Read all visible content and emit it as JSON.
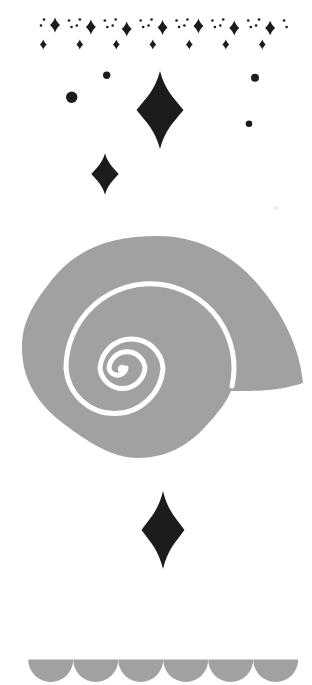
{
  "illustration": {
    "kind": "decorative-illustration",
    "description": "snail shell with sparkles and scallop trim",
    "canvas": {
      "width": 312,
      "height": 685,
      "background": "#ffffff"
    },
    "palette": {
      "gray": "#a1a1a1",
      "black": "#1c1c1c",
      "white": "#ffffff",
      "faint": "#dedede"
    },
    "sparkle_border": {
      "units": 7,
      "medium_start_x": 55,
      "medium_spacing": 35.85,
      "medium_y": 27,
      "medium_y_jitter": [
        -2,
        0,
        2,
        0.5,
        -1,
        1,
        1
      ],
      "medium_half_w": 5,
      "medium_half_h": 7.5,
      "small_start_x": 43.3,
      "small_spacing": 36.5,
      "small_y": 44.5,
      "small_half_w": 3.4,
      "small_half_h": 5,
      "dot_offsets": [
        {
          "dx": -14,
          "y": 25.5
        },
        {
          "dx": -11,
          "y": 19.5
        },
        {
          "dx": 14,
          "y": 20.5
        },
        {
          "dx": 16.5,
          "y": 27
        }
      ],
      "dot_r": 1.3
    },
    "scatter_dots": [
      {
        "x": 106.7,
        "y": 75.3,
        "r": 3.7
      },
      {
        "x": 71.7,
        "y": 97.3,
        "r": 5.7
      },
      {
        "x": 255,
        "y": 77.7,
        "r": 4
      },
      {
        "x": 249,
        "y": 123.7,
        "r": 3.3
      }
    ],
    "stars": [
      {
        "name": "large-star",
        "x": 160,
        "y": 110,
        "half_w": 23.5,
        "half_h": 39
      },
      {
        "name": "medium-star",
        "x": 105,
        "y": 174,
        "half_w": 13.7,
        "half_h": 20.8
      },
      {
        "name": "bottom-star",
        "x": 163,
        "y": 530,
        "half_w": 21.5,
        "half_h": 39
      }
    ],
    "faint_speck": {
      "x": 276,
      "y": 208,
      "r": 2
    },
    "shell": {
      "body_path": "M 303 383 C 300 350 285 315 255 281 C 230 253 196 236 158 236 C 110 236 75 248 48 285 C 28 310 22 328 22 348 C 22 382 40 406 64 424 C 88 442 112 458 138 458 C 165 458 188 446 205 427 C 218 413 226 403 231 391 C 250 391 275 392 303 383 Z",
      "spiral_path": "M 232 386 A 84 84 0 1 0 66 368 A 48.6 48.6 0 0 0 163 368 A 31.6 31.6 0 0 0 100 368 A 22.6 22.6 0 0 0 145 368 A 18.1 18.1 0 0 0 109 368 A 8.6 8.6 0 0 0 126 368",
      "spiral_stroke_width": 5,
      "center_dot": {
        "x": 122,
        "y": 369,
        "r": 4.2
      }
    },
    "scallops": {
      "count": 6,
      "radius": 22.5,
      "top_y": 659.5,
      "start_x": 28.2
    }
  }
}
